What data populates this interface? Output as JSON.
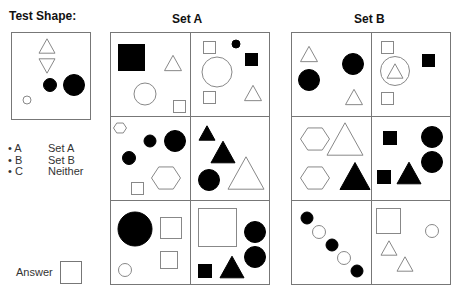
{
  "labels": {
    "test_shape": "Test Shape:",
    "set_a": "Set A",
    "set_b": "Set B",
    "answer": "Answer"
  },
  "legend": [
    {
      "key": "• A",
      "value": "Set A"
    },
    {
      "key": "• B",
      "value": "Set B"
    },
    {
      "key": "• C",
      "value": "Neither"
    }
  ],
  "colors": {
    "stroke": "#888888",
    "grid": "#777777",
    "fill_dark": "#000000"
  },
  "test_shape": {
    "box": [
      11,
      32,
      79,
      87
    ],
    "shapes": [
      {
        "type": "triangle-up",
        "cx": 47,
        "cy": 46,
        "size": 16,
        "fill": false
      },
      {
        "type": "triangle-down",
        "cx": 47,
        "cy": 66,
        "size": 16,
        "fill": false
      },
      {
        "type": "circle",
        "cx": 50,
        "cy": 85,
        "r": 6.5,
        "fill": true
      },
      {
        "type": "circle",
        "cx": 74,
        "cy": 85,
        "r": 10.5,
        "fill": true
      },
      {
        "type": "circle",
        "cx": 27,
        "cy": 100,
        "r": 4,
        "fill": false
      }
    ]
  },
  "set_a": {
    "box": [
      110,
      32,
      269,
      284
    ],
    "cells": [
      [
        {
          "type": "square",
          "x": 118,
          "y": 44,
          "w": 26,
          "h": 26,
          "fill": true
        },
        {
          "type": "triangle-up",
          "cx": 173,
          "cy": 63,
          "size": 17,
          "fill": false
        },
        {
          "type": "circle",
          "cx": 145,
          "cy": 94,
          "r": 11,
          "fill": false
        },
        {
          "type": "square",
          "x": 173,
          "y": 100,
          "w": 12,
          "h": 12,
          "fill": false
        }
      ],
      [
        {
          "type": "square",
          "x": 203,
          "y": 41,
          "w": 12,
          "h": 12,
          "fill": false
        },
        {
          "type": "circle",
          "cx": 236,
          "cy": 44,
          "r": 4,
          "fill": true
        },
        {
          "type": "square",
          "x": 245,
          "y": 53,
          "w": 12,
          "h": 12,
          "fill": true
        },
        {
          "type": "circle",
          "cx": 217,
          "cy": 72,
          "r": 15,
          "fill": false
        },
        {
          "type": "square",
          "x": 203,
          "y": 91,
          "w": 12,
          "h": 12,
          "fill": false
        },
        {
          "type": "triangle-up",
          "cx": 253,
          "cy": 93,
          "size": 17,
          "fill": false
        }
      ],
      [
        {
          "type": "hexagon",
          "cx": 120,
          "cy": 128,
          "r": 6.5,
          "fill": false
        },
        {
          "type": "circle",
          "cx": 150,
          "cy": 141,
          "r": 6,
          "fill": true
        },
        {
          "type": "circle",
          "cx": 175,
          "cy": 141,
          "r": 10.5,
          "fill": true
        },
        {
          "type": "circle",
          "cx": 129,
          "cy": 158,
          "r": 6.5,
          "fill": true
        },
        {
          "type": "hexagon",
          "cx": 166,
          "cy": 178,
          "r": 14.5,
          "fill": false
        },
        {
          "type": "square",
          "x": 131,
          "y": 182,
          "w": 12,
          "h": 12,
          "fill": false
        }
      ],
      [
        {
          "type": "triangle-up",
          "cx": 207,
          "cy": 133,
          "size": 16,
          "fill": true
        },
        {
          "type": "triangle-up",
          "cx": 223,
          "cy": 152,
          "size": 24,
          "fill": true
        },
        {
          "type": "circle",
          "cx": 209,
          "cy": 180,
          "r": 10.5,
          "fill": true
        },
        {
          "type": "triangle-up",
          "cx": 246,
          "cy": 173,
          "size": 36,
          "fill": false
        }
      ],
      [
        {
          "type": "circle",
          "cx": 135,
          "cy": 229,
          "r": 17,
          "fill": true
        },
        {
          "type": "square",
          "x": 160,
          "y": 217,
          "w": 21,
          "h": 21,
          "fill": false
        },
        {
          "type": "square",
          "x": 160,
          "y": 251,
          "w": 17,
          "h": 17,
          "fill": false
        },
        {
          "type": "circle",
          "cx": 125,
          "cy": 270,
          "r": 6.5,
          "fill": false
        }
      ],
      [
        {
          "type": "square",
          "x": 198,
          "y": 208,
          "w": 38,
          "h": 38,
          "fill": false
        },
        {
          "type": "circle",
          "cx": 255,
          "cy": 232,
          "r": 10.5,
          "fill": true
        },
        {
          "type": "circle",
          "cx": 255,
          "cy": 257,
          "r": 10.5,
          "fill": true
        },
        {
          "type": "square",
          "x": 198,
          "y": 264,
          "w": 13,
          "h": 13,
          "fill": true
        },
        {
          "type": "triangle-up",
          "cx": 232,
          "cy": 267,
          "size": 24,
          "fill": true
        }
      ]
    ]
  },
  "set_b": {
    "box": [
      291,
      32,
      450,
      284
    ],
    "cells": [
      [
        {
          "type": "triangle-up",
          "cx": 309,
          "cy": 54,
          "size": 17,
          "fill": false
        },
        {
          "type": "circle",
          "cx": 353,
          "cy": 64,
          "r": 10.5,
          "fill": true
        },
        {
          "type": "circle",
          "cx": 309,
          "cy": 80,
          "r": 10.5,
          "fill": true
        },
        {
          "type": "triangle-up",
          "cx": 354,
          "cy": 97,
          "size": 17,
          "fill": false
        }
      ],
      [
        {
          "type": "square",
          "x": 381,
          "y": 41,
          "w": 12,
          "h": 12,
          "fill": false
        },
        {
          "type": "square",
          "x": 422,
          "y": 54,
          "w": 12,
          "h": 12,
          "fill": true
        },
        {
          "type": "circle",
          "cx": 395,
          "cy": 71,
          "r": 14.5,
          "fill": false
        },
        {
          "type": "triangle-up",
          "cx": 395,
          "cy": 71,
          "size": 16,
          "fill": false
        },
        {
          "type": "square",
          "x": 381,
          "y": 92,
          "w": 12,
          "h": 12,
          "fill": false
        }
      ],
      [
        {
          "type": "hexagon",
          "cx": 315,
          "cy": 139,
          "r": 14.5,
          "fill": false
        },
        {
          "type": "triangle-up",
          "cx": 345,
          "cy": 139,
          "size": 36,
          "fill": false
        },
        {
          "type": "hexagon",
          "cx": 315,
          "cy": 178,
          "r": 14.5,
          "fill": false
        },
        {
          "type": "triangle-up",
          "cx": 355,
          "cy": 176,
          "size": 30,
          "fill": true
        }
      ],
      [
        {
          "type": "square",
          "x": 383,
          "y": 131,
          "w": 13,
          "h": 13,
          "fill": true
        },
        {
          "type": "circle",
          "cx": 432,
          "cy": 137,
          "r": 10.5,
          "fill": true
        },
        {
          "type": "circle",
          "cx": 432,
          "cy": 162,
          "r": 10.5,
          "fill": true
        },
        {
          "type": "square",
          "x": 377,
          "y": 170,
          "w": 13,
          "h": 13,
          "fill": true
        },
        {
          "type": "triangle-up",
          "cx": 409,
          "cy": 173,
          "size": 24,
          "fill": true
        }
      ],
      [
        {
          "type": "circle",
          "cx": 307,
          "cy": 218,
          "r": 6,
          "fill": true
        },
        {
          "type": "circle",
          "cx": 319,
          "cy": 232,
          "r": 6.5,
          "fill": false
        },
        {
          "type": "circle",
          "cx": 332,
          "cy": 245,
          "r": 6,
          "fill": true
        },
        {
          "type": "circle",
          "cx": 344,
          "cy": 258,
          "r": 6.5,
          "fill": false
        },
        {
          "type": "circle",
          "cx": 357,
          "cy": 271,
          "r": 6,
          "fill": true
        }
      ],
      [
        {
          "type": "square",
          "x": 376,
          "y": 208,
          "w": 24,
          "h": 25,
          "fill": false
        },
        {
          "type": "circle",
          "cx": 432,
          "cy": 231,
          "r": 6.5,
          "fill": false
        },
        {
          "type": "triangle-up",
          "cx": 389,
          "cy": 248,
          "size": 16,
          "fill": false
        },
        {
          "type": "triangle-up",
          "cx": 405,
          "cy": 264,
          "size": 16,
          "fill": false
        }
      ]
    ]
  }
}
